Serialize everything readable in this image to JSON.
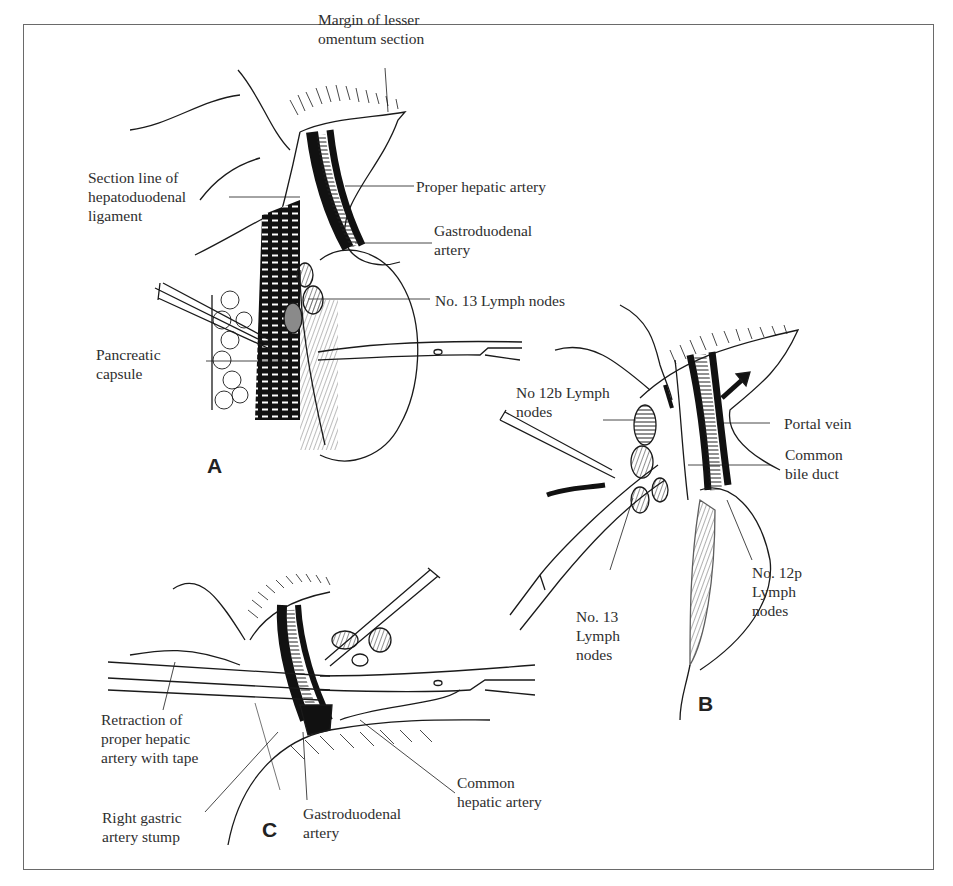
{
  "figure": {
    "border_color": "#6a6a6a",
    "ink_color": "#1a1a1a",
    "node_fill": "#8a8a8a",
    "panels": [
      {
        "id": "A",
        "label": "A"
      },
      {
        "id": "B",
        "label": "B"
      },
      {
        "id": "C",
        "label": "C"
      }
    ]
  },
  "panel_a": {
    "labels": {
      "margin_lesser_omentum": [
        "Margin of lesser",
        "omentum section"
      ],
      "section_line": [
        "Section line of",
        "hepatoduodenal",
        "ligament"
      ],
      "proper_hepatic_artery": "Proper hepatic artery",
      "gastroduodenal_artery": [
        "Gastroduodenal",
        "artery"
      ],
      "no13_lymph_nodes": "No. 13 Lymph nodes",
      "pancreatic_capsule": [
        "Pancreatic",
        "capsule"
      ]
    }
  },
  "panel_b": {
    "labels": {
      "no12b_lymph_nodes": [
        "No 12b Lymph",
        "nodes"
      ],
      "portal_vein": "Portal vein",
      "common_bile_duct": [
        "Common",
        "bile duct"
      ],
      "no12p_lymph_nodes": [
        "No. 12p",
        "Lymph",
        "nodes"
      ],
      "no13_lymph_nodes": [
        "No. 13",
        "Lymph",
        "nodes"
      ]
    }
  },
  "panel_c": {
    "labels": {
      "retraction": [
        "Retraction of",
        "proper hepatic",
        "artery with tape"
      ],
      "right_gastric_stump": [
        "Right gastric",
        "artery stump"
      ],
      "gastroduodenal_artery": [
        "Gastroduodenal",
        "artery"
      ],
      "common_hepatic_artery": [
        "Common",
        "hepatic artery"
      ]
    }
  }
}
